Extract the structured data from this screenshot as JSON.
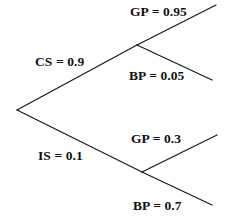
{
  "diagram": {
    "type": "probability-tree",
    "background_color": "#ffffff",
    "line_color": "#1a1a1a",
    "text_color": "#111111"
  },
  "labels": {
    "root_upper": "CS = 0.9",
    "root_lower": "IS = 0.1",
    "upper_branch_top": "GP = 0.95",
    "upper_branch_bottom": "BP = 0.05",
    "lower_branch_top": "GP = 0.3",
    "lower_branch_bottom": "BP = 0.7"
  },
  "chart_data": {
    "type": "tree",
    "title": "",
    "nodes": [
      {
        "id": "root",
        "x": 17,
        "y": 110
      },
      {
        "id": "upper",
        "x": 137,
        "y": 45
      },
      {
        "id": "lower",
        "x": 142,
        "y": 172
      }
    ],
    "edges": [
      {
        "from": "root",
        "to": "upper",
        "label": "CS = 0.9",
        "code": "CS",
        "value": 0.9,
        "x1": 17,
        "y1": 110,
        "x2": 137,
        "y2": 45
      },
      {
        "from": "root",
        "to": "lower",
        "label": "IS = 0.1",
        "code": "IS",
        "value": 0.1,
        "x1": 17,
        "y1": 110,
        "x2": 142,
        "y2": 172
      },
      {
        "from": "upper",
        "to": "leaf-gp-095",
        "label": "GP = 0.95",
        "code": "GP",
        "value": 0.95,
        "x1": 137,
        "y1": 45,
        "x2": 216,
        "y2": 5
      },
      {
        "from": "upper",
        "to": "leaf-bp-005",
        "label": "BP = 0.05",
        "code": "BP",
        "value": 0.05,
        "x1": 137,
        "y1": 45,
        "x2": 212,
        "y2": 80
      },
      {
        "from": "lower",
        "to": "leaf-gp-03",
        "label": "GP = 0.3",
        "code": "GP",
        "value": 0.3,
        "x1": 142,
        "y1": 172,
        "x2": 217,
        "y2": 135
      },
      {
        "from": "lower",
        "to": "leaf-bp-07",
        "label": "BP = 0.7",
        "code": "BP",
        "value": 0.7,
        "x1": 142,
        "y1": 172,
        "x2": 212,
        "y2": 205
      }
    ]
  }
}
